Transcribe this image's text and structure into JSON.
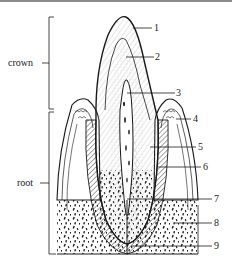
{
  "figure": {
    "regions": [
      {
        "id": "crown",
        "label": "crown"
      },
      {
        "id": "root",
        "label": "root"
      }
    ],
    "callouts": [
      {
        "number": "1"
      },
      {
        "number": "2"
      },
      {
        "number": "3"
      },
      {
        "number": "4"
      },
      {
        "number": "5"
      },
      {
        "number": "6"
      },
      {
        "number": "7"
      },
      {
        "number": "8"
      },
      {
        "number": "9"
      }
    ]
  },
  "colors": {
    "ink": "#1a1a1a",
    "background": "#ffffff",
    "topbar": "#8a8a8a"
  }
}
